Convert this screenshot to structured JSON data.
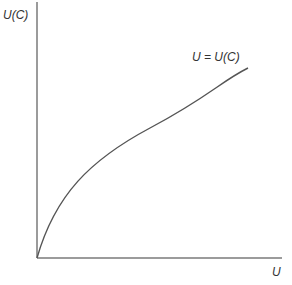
{
  "diagram": {
    "type": "utility-function-graph",
    "y_axis_label": "U(C)",
    "x_axis_label": "U",
    "curve_label": "U = U(C)",
    "curve_shape": "concave, increasing from origin",
    "colors": {
      "axis": "#7a7a7a",
      "curve": "#555555",
      "text": "#333333",
      "background": "#ffffff"
    }
  }
}
